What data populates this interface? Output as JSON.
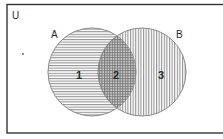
{
  "diagram": {
    "type": "venn",
    "universe_label": "U",
    "sets": [
      {
        "name": "A",
        "label": "A"
      },
      {
        "name": "B",
        "label": "B"
      }
    ],
    "regions": [
      {
        "id": "1",
        "label": "1",
        "description": "A only",
        "pattern": "horizontal-lines"
      },
      {
        "id": "2",
        "label": "2",
        "description": "A and B",
        "pattern": "crosshatch"
      },
      {
        "id": "3",
        "label": "3",
        "description": "B only",
        "pattern": "vertical-lines"
      }
    ],
    "colors": {
      "border": "#333333",
      "hatch": "#8a8a8a",
      "background": "#ffffff"
    }
  }
}
